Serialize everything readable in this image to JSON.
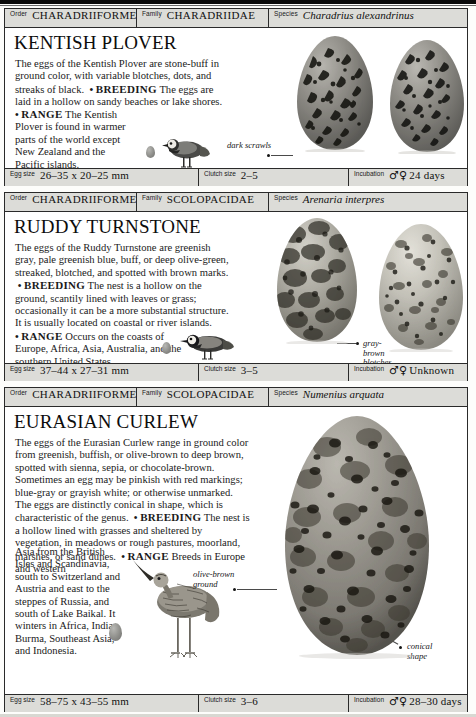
{
  "page": {
    "kind": "field-guide-page",
    "entry_count": 3
  },
  "labels": {
    "order": "Order",
    "family": "Family",
    "species": "Species",
    "egg_size": "Egg size",
    "clutch_size": "Clutch size",
    "incubation": "Incubation",
    "sex_symbols": "♂♀"
  },
  "entries": [
    {
      "order": "CHARADRIIFORMES",
      "family": "CHARADRIIDAE",
      "species": "Charadrius alexandrinus",
      "title": "KENTISH PLOVER",
      "intro": "The eggs of the Kentish Plover are stone-buff in ground color, with variable blotches, dots, and streaks of black.",
      "breeding_heading": "BREEDING",
      "breeding": "The eggs are laid in a hollow on sandy beaches or lake shores.",
      "range_heading": "RANGE",
      "range": "The Kentish Plover is found in warmer parts of the world except New Zealand and the Pacific islands.",
      "callouts": [
        "dark scrawls"
      ],
      "egg_size": "26–35 x 20–25 mm",
      "clutch_size": "2–5",
      "incubation": "24 days",
      "egg_count": 2
    },
    {
      "order": "CHARADRIIFORMES",
      "family": "SCOLOPACIDAE",
      "species": "Arenaria interpres",
      "title": "RUDDY TURNSTONE",
      "intro": "The eggs of the Ruddy Turnstone are greenish gray, pale greenish blue, buff, or deep olive-green, streaked, blotched, and spotted with brown marks.",
      "breeding_heading": "BREEDING",
      "breeding": "The nest is a hollow on the ground, scantily lined with leaves or grass; occasionally it can be a more substantial structure. It is usually located on coastal or river islands.",
      "range_heading": "RANGE",
      "range": "Occurs on the coasts of Europe, Africa, Asia, Australia, and the southern United States.",
      "callouts": [
        "gray-",
        "brown",
        "blotches"
      ],
      "egg_size": "37–44 x 27–31 mm",
      "clutch_size": "3–5",
      "incubation": "Unknown",
      "egg_count": 2
    },
    {
      "order": "CHARADRIIFORMES",
      "family": "SCOLOPACIDAE",
      "species": "Numenius arquata",
      "title": "EURASIAN CURLEW",
      "intro": "The eggs of the Eurasian Curlew range in ground color from greenish, buffish, or olive-brown to deep brown, spotted with sienna, sepia, or chocolate-brown. Sometimes an egg may be pinkish with red markings; blue-gray or grayish white; or otherwise unmarked. The eggs are distinctly conical in shape, which is characteristic of the genus.",
      "breeding_heading": "BREEDING",
      "breeding": "The nest is a hollow lined with grasses and sheltered by vegetation, in meadows or rough pastures, moorland, marshes, or sand dunes.",
      "range_heading": "RANGE",
      "range_wide": "Breeds in Europe and western",
      "range_narrow": "Asia from the British Isles and Scandinavia, south to Switzerland and Austria and east to the steppes of Russia, and south of Lake Baikal. It winters in Africa, India, Burma, Southeast Asia, and Indonesia.",
      "callouts": [
        "olive-brown",
        "ground",
        "conical",
        "shape"
      ],
      "egg_size": "58–75 x 43–55 mm",
      "clutch_size": "3–6",
      "incubation": "28–30 days",
      "egg_count": 1
    }
  ],
  "colors": {
    "bar_background": "#dcdcd8",
    "rule": "#2a2a2a",
    "text": "#1a1a1a",
    "page": "#ffffff"
  }
}
